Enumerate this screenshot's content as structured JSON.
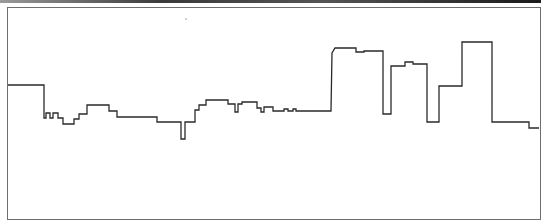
{
  "canvas": {
    "line_color": "#2a2a2a",
    "border_color": "#6e6e6e",
    "background": "#ffffff",
    "skyline_points": "8,85 44,85 44,118 46,118 46,113 50,113 50,118 53,118 53,113 58,113 58,118 63,118 63,124 74,124 74,119 79,119 79,114 87,114 87,105 109,105 109,111 117,111 117,117 157,117 157,122 181,122 181,139 185,139 185,122 195,122 195,110 199,110 199,105 206,105 206,100 228,100 228,104 235,104 235,112 238,112 238,104 242,104 242,102 257,102 257,108 261,108 261,112 264,112 264,107 273,107 273,111 284,111 284,109 288,109 288,111 293,111 293,109 296,109 296,111 331,111 332,53 335,48 356,48 356,52 364,52 364,51 383,51 383,114 391,114 391,66 405,66 405,62 413,62 413,64 427,64 427,122 439,122 439,86 462,86 462,42 492,42 492,122 529,122 529,128 539,128"
  }
}
